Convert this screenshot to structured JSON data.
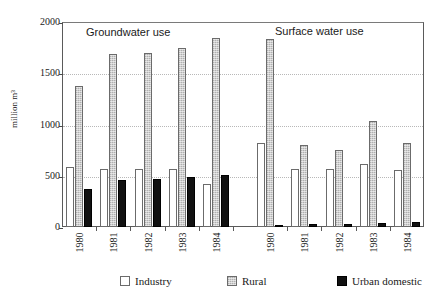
{
  "chart_data": {
    "type": "bar",
    "title": "",
    "xlabel": "",
    "ylabel": "million m³",
    "ylim": [
      0,
      2000
    ],
    "yticks": [
      0,
      500,
      1000,
      1500,
      2000
    ],
    "ytick_labels": [
      "0",
      "500",
      "1000",
      "1500",
      "2000"
    ],
    "grid": true,
    "legend_position": "bottom",
    "orientation": "vertical",
    "grouping": "clustered",
    "panels": [
      {
        "label": "Groundwater use",
        "categories": [
          "1980",
          "1981",
          "1982",
          "1983",
          "1984"
        ],
        "series": [
          {
            "name": "Industry",
            "color": "#ffffff",
            "values": [
              590,
              570,
              565,
              570,
              415
            ]
          },
          {
            "name": "Rural",
            "color": "#c4c4c4",
            "values": [
              1375,
              1690,
              1700,
              1745,
              1840
            ]
          },
          {
            "name": "Urban domestic",
            "color": "#111111",
            "values": [
              370,
              460,
              470,
              485,
              510
            ]
          }
        ]
      },
      {
        "label": "Surface water use",
        "categories": [
          "1980",
          "1981",
          "1982",
          "1983",
          "1984"
        ],
        "series": [
          {
            "name": "Industry",
            "color": "#ffffff",
            "values": [
              820,
              570,
              565,
              610,
              555
            ]
          },
          {
            "name": "Rural",
            "color": "#c4c4c4",
            "values": [
              1830,
              805,
              750,
              1035,
              820
            ]
          },
          {
            "name": "Urban domestic",
            "color": "#111111",
            "values": [
              10,
              25,
              30,
              40,
              45
            ]
          }
        ]
      }
    ],
    "legend": [
      {
        "name": "Industry",
        "color": "#ffffff"
      },
      {
        "name": "Rural",
        "color": "#c4c4c4"
      },
      {
        "name": "Urban domestic",
        "color": "#111111"
      }
    ]
  }
}
